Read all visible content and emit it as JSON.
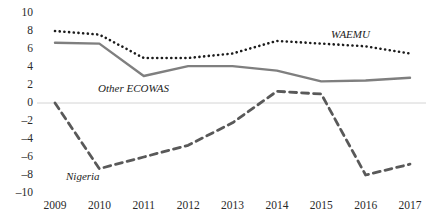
{
  "chart_data": {
    "type": "line",
    "title": "",
    "xlabel": "",
    "ylabel": "",
    "x": [
      2009,
      2010,
      2011,
      2012,
      2013,
      2014,
      2015,
      2016,
      2017
    ],
    "categories": [
      "2009",
      "2010",
      "2011",
      "2012",
      "2013",
      "2014",
      "2015",
      "2016",
      "2017"
    ],
    "ylim": [
      -10,
      10
    ],
    "xlim": [
      2009,
      2017
    ],
    "yticks": [
      10,
      8,
      6,
      4,
      2,
      0,
      -2,
      -4,
      -6,
      -8,
      -10
    ],
    "ytick_labels": [
      "10",
      "8",
      "6",
      "4",
      "2",
      "0",
      "–2",
      "–4",
      "–6",
      "–8",
      "–10"
    ],
    "grid": false,
    "zero_line": true,
    "legend_position": "inline-annotations",
    "series": [
      {
        "name": "WAEMU",
        "style": "dotted",
        "color": "#1c1c1c",
        "values": [
          8.0,
          7.6,
          5.0,
          5.0,
          5.5,
          6.9,
          6.6,
          6.3,
          5.5
        ]
      },
      {
        "name": "Other ECOWAS",
        "style": "solid",
        "color": "#7f7f7f",
        "values": [
          6.7,
          6.6,
          3.0,
          4.1,
          4.1,
          3.6,
          2.4,
          2.5,
          2.8
        ]
      },
      {
        "name": "Nigeria",
        "style": "dashed",
        "color": "#595959",
        "values": [
          0.0,
          -7.3,
          -6.0,
          -4.7,
          -2.2,
          1.3,
          1.0,
          -8.0,
          -6.8
        ]
      }
    ],
    "annotations": [
      {
        "text": "WAEMU",
        "series": "WAEMU"
      },
      {
        "text": "Other ECOWAS",
        "series": "Other ECOWAS"
      },
      {
        "text": "Nigeria",
        "series": "Nigeria"
      }
    ]
  }
}
